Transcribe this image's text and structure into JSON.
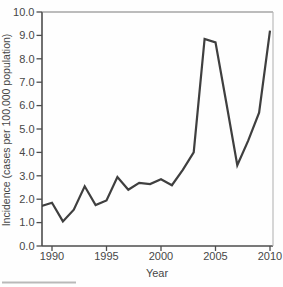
{
  "figure": {
    "background": "#fefefe",
    "line_color": "#3f3f3f",
    "axis_color": "#4d4d4d",
    "text_color": "#474747"
  },
  "chart_data": {
    "type": "line",
    "title": "",
    "xlabel": "Year",
    "ylabel": "Incidence (cases per 100,000 population)",
    "x": [
      1989,
      1990,
      1991,
      1992,
      1993,
      1994,
      1995,
      1996,
      1997,
      1998,
      1999,
      2000,
      2001,
      2002,
      2003,
      2004,
      2005,
      2006,
      2007,
      2008,
      2009,
      2010
    ],
    "values": [
      1.7,
      1.85,
      1.05,
      1.55,
      2.55,
      1.75,
      1.95,
      2.95,
      2.4,
      2.7,
      2.65,
      2.85,
      2.6,
      3.25,
      4.0,
      8.85,
      8.7,
      6.1,
      3.45,
      4.5,
      5.7,
      9.2
    ],
    "xlim": [
      1989.1,
      2010.3
    ],
    "ylim": [
      0,
      10
    ],
    "x_tick_values": [
      1990,
      1995,
      2000,
      2005,
      2010
    ],
    "x_tick_labels": [
      "1990",
      "1995",
      "2000",
      "2005",
      "2010"
    ],
    "y_tick_values": [
      0,
      1,
      2,
      3,
      4,
      5,
      6,
      7,
      8,
      9,
      10
    ],
    "y_tick_labels": [
      "0.0",
      "1.0",
      "2.0",
      "3.0",
      "4.0",
      "5.0",
      "6.0",
      "7.0",
      "8.0",
      "9.0",
      "10.0"
    ],
    "grid": false,
    "legend": null,
    "line_color": "#3f3f3f"
  }
}
